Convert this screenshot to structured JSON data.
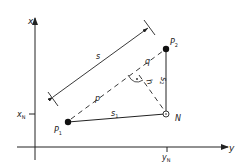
{
  "diagram": {
    "axes": {
      "vertical_label": "x",
      "horizontal_label": "y",
      "x_tick_label": "x",
      "x_tick_sub": "N",
      "y_tick_label": "y",
      "y_tick_sub": "N"
    },
    "points": {
      "p1": {
        "label": "P",
        "sub": "1"
      },
      "p2": {
        "label": "P",
        "sub": "2"
      },
      "n": {
        "label": "N"
      }
    },
    "segments": {
      "s": "s",
      "s1": {
        "label": "s",
        "sub": "1"
      },
      "s2": {
        "label": "s",
        "sub": "2"
      },
      "p": "p",
      "q": "q",
      "h": "h"
    },
    "colors": {
      "stroke": "#222222",
      "background": "#ffffff"
    }
  }
}
